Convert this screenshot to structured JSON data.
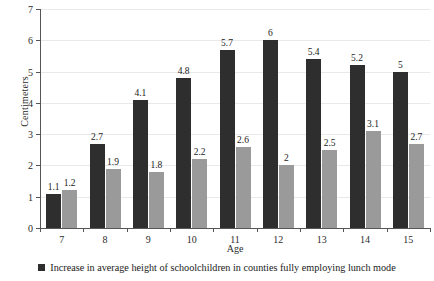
{
  "chart_data": {
    "type": "bar",
    "title": "",
    "xlabel": "Age",
    "ylabel": "Centimeters",
    "categories": [
      "7",
      "8",
      "9",
      "10",
      "11",
      "12",
      "13",
      "14",
      "15"
    ],
    "series": [
      {
        "name": "Increase in average height of schoolchildren in counties fully employing lunch mode",
        "color": "#2e2e2e",
        "values": [
          1.1,
          2.7,
          4.1,
          4.8,
          5.7,
          6,
          5.4,
          5.2,
          5
        ],
        "labels": [
          "1.1",
          "2.7",
          "4.1",
          "4.8",
          "5.7",
          "6",
          "5.4",
          "5.2",
          "5"
        ]
      },
      {
        "name": "",
        "color": "#9a9a9a",
        "values": [
          1.2,
          1.9,
          1.8,
          2.2,
          2.6,
          2,
          2.5,
          3.1,
          2.7
        ],
        "labels": [
          "1.2",
          "1.9",
          "1.8",
          "2.2",
          "2.6",
          "2",
          "2.5",
          "3.1",
          "2.7"
        ]
      }
    ],
    "ylim": [
      0,
      7
    ],
    "yticks": [
      0,
      1,
      2,
      3,
      4,
      5,
      6,
      7
    ],
    "ytick_labels": [
      "0",
      "1",
      "2",
      "3",
      "4",
      "5",
      "6",
      "7"
    ],
    "grid": true,
    "legend_position": "bottom"
  },
  "legend": {
    "items": [
      {
        "marker": "dark-square-marker",
        "label": "Increase in average height of schoolchildren in counties fully employing lunch mode"
      }
    ]
  }
}
